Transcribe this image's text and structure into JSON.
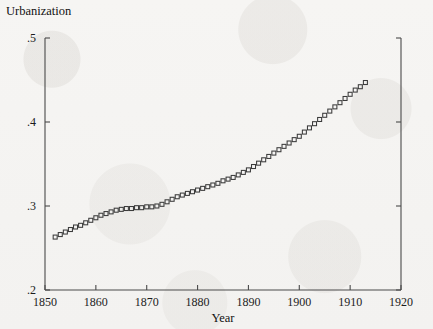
{
  "chart_data": {
    "type": "scatter",
    "title": "Urbanization",
    "xlabel": "Year",
    "ylabel": "",
    "xlim": [
      1850,
      1920
    ],
    "ylim": [
      0.2,
      0.5
    ],
    "grid": false,
    "legend": null,
    "marker": "open-square",
    "xticks": [
      1850,
      1860,
      1870,
      1880,
      1890,
      1900,
      1910,
      1920
    ],
    "xticklabels": [
      "1850",
      "1860",
      "1870",
      "1880",
      "1890",
      "1900",
      "1910",
      "1920"
    ],
    "yticks": [
      0.2,
      0.3,
      0.4,
      0.5
    ],
    "yticklabels": [
      ".2",
      ".3",
      ".4",
      ".5"
    ],
    "series": [
      {
        "name": "Urbanization",
        "x": [
          1852,
          1853,
          1854,
          1855,
          1856,
          1857,
          1858,
          1859,
          1860,
          1861,
          1862,
          1863,
          1864,
          1865,
          1866,
          1867,
          1868,
          1869,
          1870,
          1871,
          1872,
          1873,
          1874,
          1875,
          1876,
          1877,
          1878,
          1879,
          1880,
          1881,
          1882,
          1883,
          1884,
          1885,
          1886,
          1887,
          1888,
          1889,
          1890,
          1891,
          1892,
          1893,
          1894,
          1895,
          1896,
          1897,
          1898,
          1899,
          1900,
          1901,
          1902,
          1903,
          1904,
          1905,
          1906,
          1907,
          1908,
          1909,
          1910,
          1911,
          1912,
          1913
        ],
        "y": [
          0.263,
          0.266,
          0.269,
          0.272,
          0.275,
          0.277,
          0.28,
          0.283,
          0.286,
          0.289,
          0.291,
          0.293,
          0.295,
          0.296,
          0.297,
          0.297,
          0.298,
          0.298,
          0.299,
          0.299,
          0.3,
          0.302,
          0.305,
          0.308,
          0.311,
          0.313,
          0.315,
          0.317,
          0.319,
          0.321,
          0.323,
          0.325,
          0.327,
          0.33,
          0.332,
          0.334,
          0.337,
          0.34,
          0.343,
          0.347,
          0.351,
          0.355,
          0.359,
          0.363,
          0.367,
          0.371,
          0.375,
          0.379,
          0.383,
          0.388,
          0.393,
          0.398,
          0.403,
          0.408,
          0.413,
          0.418,
          0.423,
          0.428,
          0.433,
          0.438,
          0.442,
          0.447
        ]
      }
    ]
  },
  "colors": {
    "background": "#f4f3f1",
    "axis": "#4a4a4a",
    "marker_stroke": "#3b3b3b",
    "text": "#111111"
  }
}
